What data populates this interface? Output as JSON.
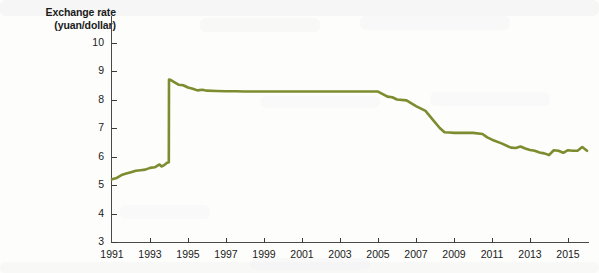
{
  "chart_data": {
    "type": "line",
    "title": "",
    "ylabel_line1": "Exchange rate",
    "ylabel_line2": "(yuan/dollar)",
    "xlabel": "",
    "ylim": [
      3,
      10
    ],
    "xlim": [
      1991,
      2016
    ],
    "grid": false,
    "legend": "none",
    "line_color": "#7d8c2e",
    "ytick_labels": [
      "10",
      "9",
      "8",
      "7",
      "6",
      "5",
      "4",
      "3"
    ],
    "ytick_values": [
      10,
      9,
      8,
      7,
      6,
      5,
      4,
      3
    ],
    "xtick_labels": [
      "1991",
      "1993",
      "1995",
      "1997",
      "1999",
      "2001",
      "2003",
      "2005",
      "2007",
      "2009",
      "2011",
      "2013",
      "2015"
    ],
    "xtick_values": [
      1991,
      1993,
      1995,
      1997,
      1999,
      2001,
      2003,
      2005,
      2007,
      2009,
      2011,
      2013,
      2015
    ],
    "series": [
      {
        "name": "Yuan per US dollar",
        "x": [
          1991.0,
          1991.25,
          1991.5,
          1991.75,
          1992.0,
          1992.25,
          1992.5,
          1992.75,
          1993.0,
          1993.25,
          1993.5,
          1993.6,
          1993.75,
          1993.9,
          1993.99,
          1994.0,
          1994.1,
          1994.25,
          1994.5,
          1994.75,
          1995.0,
          1995.25,
          1995.5,
          1995.75,
          1996.0,
          1996.5,
          1997.0,
          1997.5,
          1998.0,
          1999.0,
          2000.0,
          2001.0,
          2002.0,
          2003.0,
          2004.0,
          2005.0,
          2005.5,
          2005.75,
          2006.0,
          2006.5,
          2007.0,
          2007.5,
          2008.0,
          2008.25,
          2008.5,
          2008.75,
          2009.0,
          2009.5,
          2010.0,
          2010.5,
          2010.75,
          2011.0,
          2011.5,
          2012.0,
          2012.25,
          2012.5,
          2012.75,
          2013.0,
          2013.25,
          2013.5,
          2013.75,
          2014.0,
          2014.25,
          2014.5,
          2014.75,
          2015.0,
          2015.25,
          2015.5,
          2015.75,
          2016.0
        ],
        "values": [
          5.2,
          5.25,
          5.35,
          5.4,
          5.45,
          5.5,
          5.52,
          5.54,
          5.6,
          5.62,
          5.72,
          5.65,
          5.7,
          5.78,
          5.8,
          8.7,
          8.68,
          8.62,
          8.52,
          8.5,
          8.42,
          8.38,
          8.32,
          8.34,
          8.31,
          8.3,
          8.29,
          8.29,
          8.28,
          8.28,
          8.28,
          8.28,
          8.28,
          8.28,
          8.28,
          8.28,
          8.1,
          8.08,
          8.0,
          7.97,
          7.77,
          7.6,
          7.2,
          7.0,
          6.85,
          6.84,
          6.83,
          6.83,
          6.83,
          6.79,
          6.67,
          6.59,
          6.46,
          6.31,
          6.3,
          6.35,
          6.28,
          6.23,
          6.2,
          6.14,
          6.11,
          6.05,
          6.22,
          6.2,
          6.13,
          6.22,
          6.2,
          6.2,
          6.33,
          6.2
        ]
      }
    ],
    "annotations": [
      {
        "label": "1994 devaluation jump",
        "x": 1994,
        "value": 8.7
      },
      {
        "label": "fixed peg",
        "x": 2000,
        "value": 8.28
      },
      {
        "label": "crisis-era peg",
        "x": 2009.5,
        "value": 6.83
      }
    ]
  },
  "axes": {
    "y_title_line1": "Exchange rate",
    "y_title_line2": "(yuan/dollar)"
  }
}
